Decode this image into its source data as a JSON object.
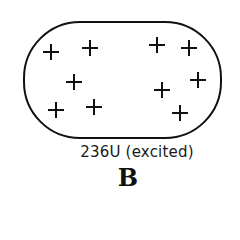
{
  "diagram": {
    "nucleus": {
      "shape": "rounded-oval",
      "outline_color": "#111111",
      "charges": [
        {
          "symbol": "+",
          "x": 51,
          "y": 52
        },
        {
          "symbol": "+",
          "x": 90,
          "y": 48
        },
        {
          "symbol": "+",
          "x": 74,
          "y": 82
        },
        {
          "symbol": "+",
          "x": 56,
          "y": 110
        },
        {
          "symbol": "+",
          "x": 94,
          "y": 107
        },
        {
          "symbol": "+",
          "x": 157,
          "y": 45
        },
        {
          "symbol": "+",
          "x": 189,
          "y": 48
        },
        {
          "symbol": "+",
          "x": 198,
          "y": 80
        },
        {
          "symbol": "+",
          "x": 162,
          "y": 90
        },
        {
          "symbol": "+",
          "x": 180,
          "y": 113
        }
      ]
    },
    "caption": "236U (excited)",
    "panel_label": "B"
  }
}
